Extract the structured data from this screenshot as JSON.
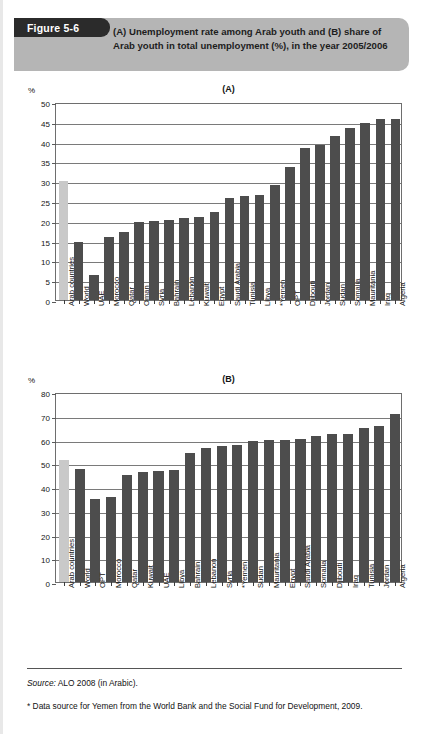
{
  "figure": {
    "tag": "Figure 5-6",
    "title": "(A) Unemployment rate among Arab youth and (B) share of Arab youth in total unemployment (%), in the year 2005/2006"
  },
  "footer": {
    "source_prefix": "Source:",
    "source_text": " ALO 2008 (in Arabic).",
    "note": "* Data source for Yemen from the World Bank and the Social Fund for Development, 2009."
  },
  "colors": {
    "bar": "#4d4d4d",
    "bar_highlight": "#c9c9c9",
    "header_band": "#b5b5b5",
    "tag_bg": "#2b2b2b",
    "frame": "#6e6e6e"
  },
  "chart_data": [
    {
      "type": "bar",
      "panel": "(A)",
      "title": "(A) Unemployment rate among Arab youth",
      "xlabel": "",
      "ylabel": "%",
      "ylim": [
        0,
        50
      ],
      "yticks": [
        0,
        5,
        10,
        15,
        20,
        25,
        30,
        35,
        40,
        45,
        50
      ],
      "grid": true,
      "legend": "none",
      "highlight_index": 0,
      "categories": [
        "Arab countries",
        "World",
        "UAE",
        "Morocco",
        "Qatar",
        "Oman",
        "Syria",
        "Bahrain",
        "Lebanon",
        "Kuwait",
        "Egypt",
        "Saudi Arabia",
        "Tunisia",
        "Libya",
        "*Yemen",
        "OPT",
        "Djibouti",
        "Jordan",
        "Sudan",
        "Somalia",
        "Mauritania",
        "Iraq",
        "Algeria"
      ],
      "values": [
        30.0,
        14.6,
        6.3,
        15.8,
        17.1,
        19.8,
        19.9,
        20.1,
        20.6,
        21.0,
        22.1,
        25.8,
        26.2,
        26.4,
        29.1,
        33.5,
        38.3,
        39.2,
        41.3,
        43.4,
        44.6,
        45.6,
        45.8
      ]
    },
    {
      "type": "bar",
      "panel": "(B)",
      "title": "(B) Share of Arab youth in total unemployment",
      "xlabel": "",
      "ylabel": "%",
      "ylim": [
        0,
        80
      ],
      "yticks": [
        0,
        10,
        20,
        30,
        40,
        50,
        60,
        70,
        80
      ],
      "grid": true,
      "legend": "none",
      "highlight_index": 0,
      "categories": [
        "Arab countries",
        "World",
        "OPT",
        "Morocco",
        "Qatar",
        "Kuwait",
        "UAE",
        "Libya",
        "Bahrain",
        "Lebanon",
        "Syria",
        "*Yemen",
        "Sudan",
        "Mauritania",
        "Egypt",
        "Saudi Arabia",
        "Somalia",
        "Djibouti",
        "Iraq",
        "Tunisia",
        "Jordan",
        "Algeria"
      ],
      "values": [
        51.3,
        47.4,
        35.0,
        35.7,
        45.2,
        46.4,
        46.7,
        47.2,
        54.4,
        56.6,
        57.3,
        57.8,
        59.5,
        59.7,
        60.0,
        60.2,
        61.6,
        62.2,
        62.5,
        64.7,
        65.9,
        70.8
      ]
    }
  ]
}
